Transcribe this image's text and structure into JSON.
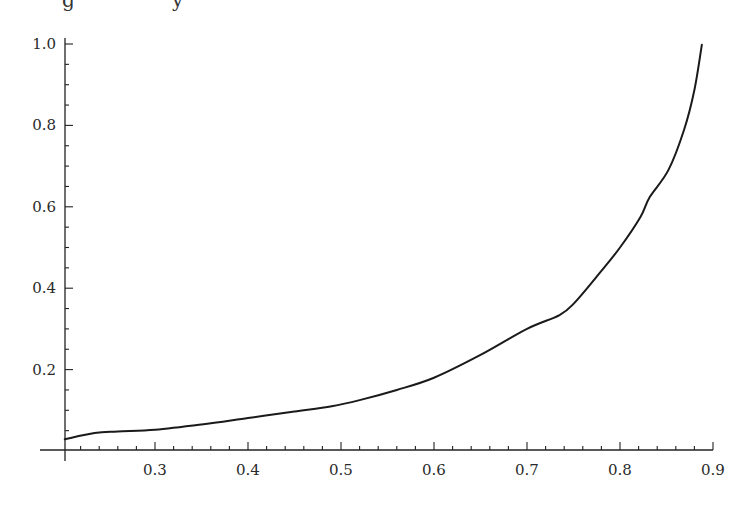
{
  "chart_data": {
    "type": "line",
    "title": "",
    "xlabel": "",
    "ylabel": "",
    "xlim": [
      0.2,
      0.9
    ],
    "ylim": [
      0.0,
      1.0
    ],
    "grid": false,
    "legend": null,
    "x_ticks": [
      0.3,
      0.4,
      0.5,
      0.6,
      0.7,
      0.8,
      0.9
    ],
    "x_tick_labels": [
      "0.3",
      "0.4",
      "0.5",
      "0.6",
      "0.7",
      "0.8",
      "0.9"
    ],
    "x_minor_step": 0.02,
    "y_ticks": [
      0.2,
      0.4,
      0.6,
      0.8,
      1.0
    ],
    "y_tick_labels": [
      "0.2",
      "0.4",
      "0.6",
      "0.8",
      "1.0"
    ],
    "y_minor_step": 0.05,
    "series": [
      {
        "name": "curve",
        "color": "#1a1a1a",
        "x": [
          0.203,
          0.235,
          0.26,
          0.3,
          0.35,
          0.4,
          0.45,
          0.49,
          0.52,
          0.56,
          0.6,
          0.65,
          0.7,
          0.735,
          0.751,
          0.778,
          0.8,
          0.822,
          0.832,
          0.852,
          0.869,
          0.88,
          0.888
        ],
        "y": [
          0.029,
          0.044,
          0.048,
          0.052,
          0.065,
          0.081,
          0.097,
          0.11,
          0.125,
          0.15,
          0.18,
          0.236,
          0.3,
          0.334,
          0.364,
          0.437,
          0.5,
          0.575,
          0.624,
          0.69,
          0.79,
          0.887,
          0.998
        ]
      }
    ]
  },
  "clipped_text_fragments": [
    "g",
    "y"
  ]
}
